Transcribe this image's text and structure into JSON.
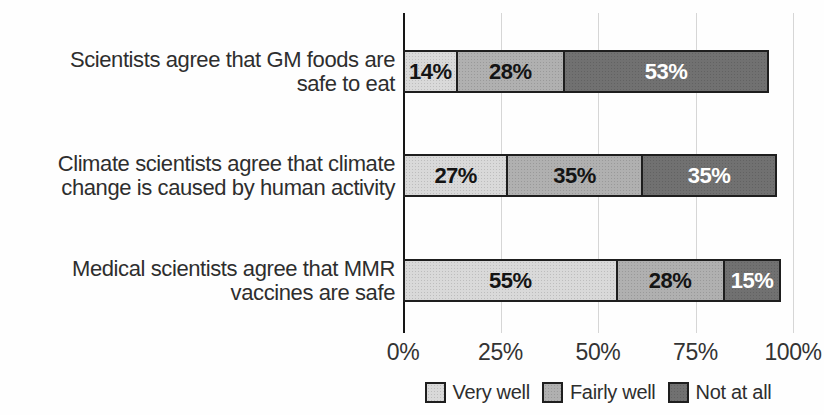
{
  "chart_data": {
    "type": "bar",
    "orientation": "horizontal",
    "stacked": true,
    "title": "",
    "categories": [
      "Scientists agree that GM foods are\nsafe to eat",
      "Climate scientists agree that climate\nchange is caused by human activity",
      "Medical scientists agree that MMR\nvaccines are safe"
    ],
    "series": [
      {
        "name": "Very well",
        "color": "#d9d9d9",
        "values": [
          14,
          27,
          55
        ]
      },
      {
        "name": "Fairly well",
        "color": "#b0b0b0",
        "values": [
          28,
          35,
          28
        ]
      },
      {
        "name": "Not at all",
        "color": "#717171",
        "values": [
          53,
          35,
          15
        ]
      }
    ],
    "value_label_suffix": "%",
    "x_ticks": [
      "0%",
      "25%",
      "50%",
      "75%",
      "100%"
    ],
    "xlim": [
      0,
      100
    ],
    "grid": true,
    "legend_position": "bottom"
  },
  "colors": {
    "background": "#fefefe",
    "gridline": "#d6d6d6",
    "axis": "#161616",
    "segment_border": "#1e1e1e",
    "label_text": "#2e2e2e",
    "value_text_dark": "#141414",
    "value_text_light": "#ffffff"
  }
}
